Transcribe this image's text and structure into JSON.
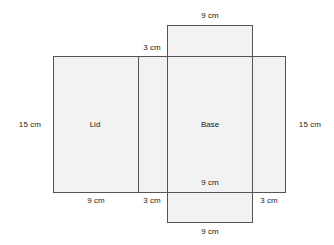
{
  "diagram": {
    "fill_color": "#f2f2f2",
    "stroke_color": "#555555",
    "text_color": "#222222",
    "unit": "cm",
    "panels": [
      {
        "key": "top_flap",
        "name": "top-flap",
        "label": "",
        "width_cm": 9,
        "height_cm": 3
      },
      {
        "key": "lid",
        "name": "lid",
        "label": "Lid",
        "width_cm": 9,
        "height_cm": 15
      },
      {
        "key": "left_flap",
        "name": "left-flap",
        "label": "",
        "width_cm": 3,
        "height_cm": 15
      },
      {
        "key": "base",
        "name": "base",
        "label": "Base",
        "width_cm": 9,
        "height_cm": 15
      },
      {
        "key": "right_flap",
        "name": "right-flap",
        "label": "",
        "width_cm": 3,
        "height_cm": 15
      },
      {
        "key": "bottom_flap",
        "name": "bottom-flap",
        "label": "",
        "width_cm": 9,
        "height_cm": 3
      }
    ],
    "panel_labels": {
      "lid": "Lid",
      "base": "Base"
    },
    "dimension_labels": {
      "top_9cm": "9 cm",
      "top_3cm": "3 cm",
      "left_15cm": "15 cm",
      "right_15cm": "15 cm",
      "base_inner_9cm": "9 cm",
      "bottom_9cm": "9 cm",
      "bottom_3cm_left": "3 cm",
      "bottom_3cm_right": "3 cm",
      "bottom_outer_9cm": "9 cm"
    }
  }
}
